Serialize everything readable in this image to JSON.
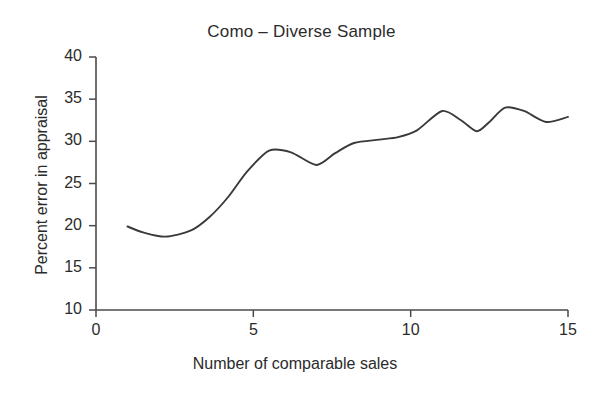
{
  "chart_data": {
    "type": "line",
    "title": "Como – Diverse Sample",
    "xlabel": "Number of comparable sales",
    "ylabel": "Percent error in appraisal",
    "xlim": [
      0,
      15
    ],
    "ylim": [
      10,
      40
    ],
    "xticks": [
      "0",
      "5",
      "10",
      "15"
    ],
    "xtick_values": [
      0,
      5,
      10,
      15
    ],
    "yticks": [
      "10",
      "15",
      "20",
      "25",
      "30",
      "35",
      "40"
    ],
    "ytick_values": [
      10,
      15,
      20,
      25,
      30,
      35,
      40
    ],
    "grid": false,
    "legend": null,
    "line_color": "#3a3a3a",
    "series": [
      {
        "name": "Percent error in appraisal",
        "x": [
          1.0,
          1.5,
          2.2,
          3.0,
          3.6,
          4.2,
          4.8,
          5.5,
          6.2,
          7.0,
          7.6,
          8.2,
          9.0,
          9.6,
          10.2,
          11.0,
          11.6,
          12.1,
          12.5,
          13.0,
          13.6,
          14.3,
          15.0
        ],
        "values": [
          19.9,
          19.2,
          18.7,
          19.4,
          21.0,
          23.4,
          26.4,
          28.9,
          28.7,
          27.2,
          28.6,
          29.8,
          30.2,
          30.5,
          31.3,
          33.6,
          32.5,
          31.2,
          32.3,
          34.0,
          33.6,
          32.3,
          32.9
        ]
      }
    ]
  },
  "axes": {
    "x_pixel_min": 96,
    "x_pixel_max": 568,
    "y_pixel_top": 57,
    "y_pixel_bottom": 310
  }
}
